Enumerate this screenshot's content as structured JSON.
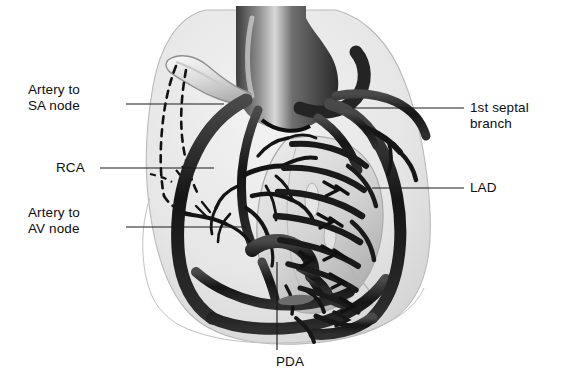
{
  "figure": {
    "kind": "anatomical-illustration",
    "background_color": "#ffffff",
    "ink_color": "#0d0d0d",
    "silhouette_color": "#e8e8e8"
  },
  "labels": {
    "sa_node": "Artery to\nSA node",
    "rca": "RCA",
    "av_node": "Artery to\nAV node",
    "septal": "1st septal\nbranch",
    "lad": "LAD",
    "pda": "PDA"
  },
  "structures": [
    {
      "name": "aorta",
      "style": "dark-trunk"
    },
    {
      "name": "right-atrial-appendage",
      "style": "light-lobe"
    },
    {
      "name": "sa-node-artery",
      "style": "dashed-hidden"
    },
    {
      "name": "right-coronary-artery",
      "style": "thick-dark-arc"
    },
    {
      "name": "left-anterior-descending-artery",
      "style": "thick-dark"
    },
    {
      "name": "first-septal-branch",
      "style": "branch"
    },
    {
      "name": "av-node-artery",
      "style": "branch"
    },
    {
      "name": "posterior-descending-artery",
      "style": "branch"
    },
    {
      "name": "pulmonary-trunk",
      "style": "light-lobe"
    }
  ]
}
